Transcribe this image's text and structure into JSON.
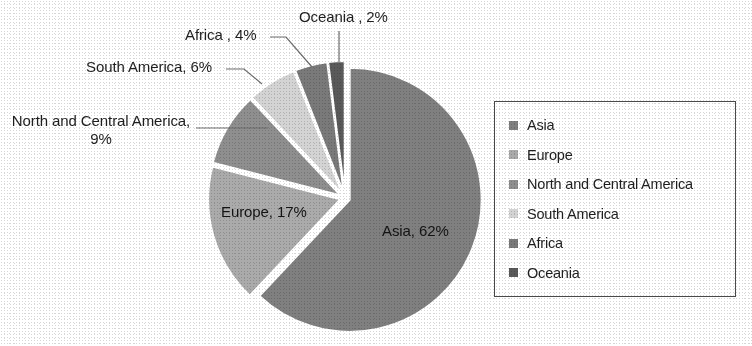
{
  "chart_data": {
    "type": "pie",
    "title": "",
    "subtitle": "",
    "xlabel": "",
    "ylabel": "",
    "grid": false,
    "legend_position": "right",
    "units": "percent",
    "start_angle_deg": 0,
    "direction": "clockwise",
    "exploded": true,
    "categories": [
      "Asia",
      "Europe",
      "North and Central America",
      "South America",
      "Africa",
      "Oceania"
    ],
    "values": [
      62,
      17,
      9,
      6,
      4,
      2
    ],
    "colors": [
      "#808080",
      "#ababab",
      "#8f8f8f",
      "#d4d4d4",
      "#7a7a7a",
      "#5a5a5a"
    ],
    "slices": [
      {
        "name": "Asia",
        "value": 62,
        "color": "#808080",
        "label": "Asia, 62%",
        "label_placement": "inside"
      },
      {
        "name": "Europe",
        "value": 17,
        "color": "#ababab",
        "label": "Europe, 17%",
        "label_placement": "inside"
      },
      {
        "name": "North and Central America",
        "value": 9,
        "color": "#8f8f8f",
        "label": "North and Central America, 9%",
        "label_placement": "outside-leader"
      },
      {
        "name": "South America",
        "value": 6,
        "color": "#d4d4d4",
        "label": "South America, 6%",
        "label_placement": "outside-leader"
      },
      {
        "name": "Africa",
        "value": 4,
        "color": "#7a7a7a",
        "label": "Africa , 4%",
        "label_placement": "outside-leader"
      },
      {
        "name": "Oceania",
        "value": 2,
        "color": "#5a5a5a",
        "label": "Oceania , 2%",
        "label_placement": "outside-leader"
      }
    ]
  },
  "labels": {
    "asia": "Asia, 62%",
    "europe": "Europe, 17%",
    "north_and_central_america": "North and Central America, 9%",
    "south_america": "South America, 6%",
    "africa": "Africa , 4%",
    "oceania": "Oceania , 2%"
  },
  "legend": {
    "items": [
      {
        "label": "Asia",
        "color": "#808080"
      },
      {
        "label": "Europe",
        "color": "#ababab"
      },
      {
        "label": "North and Central America",
        "color": "#8f8f8f"
      },
      {
        "label": "South America",
        "color": "#d4d4d4"
      },
      {
        "label": "Africa",
        "color": "#7a7a7a"
      },
      {
        "label": "Oceania",
        "color": "#5a5a5a"
      }
    ]
  }
}
